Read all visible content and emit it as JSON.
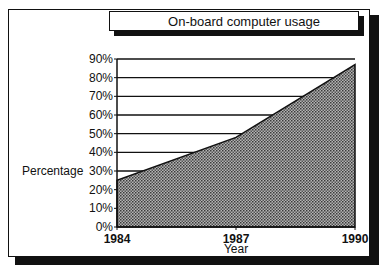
{
  "title": "On-board computer usage",
  "colors": {
    "fill": "#8a8a8a",
    "line": "#111111",
    "background": "#ffffff"
  },
  "chart_data": {
    "type": "area",
    "title": "On-board computer usage",
    "xlabel": "Year",
    "ylabel": "Percentage",
    "x": [
      1984,
      1987,
      1990
    ],
    "categories": [
      "1984",
      "1987",
      "1990"
    ],
    "series": [
      {
        "name": "On-board computer usage",
        "values": [
          25,
          48,
          87
        ]
      }
    ],
    "yticks": [
      "0%",
      "10%",
      "20%",
      "30%",
      "40%",
      "50%",
      "60%",
      "70%",
      "80%",
      "90%"
    ],
    "ylim": [
      0,
      90
    ],
    "grid": true,
    "legend": null
  }
}
